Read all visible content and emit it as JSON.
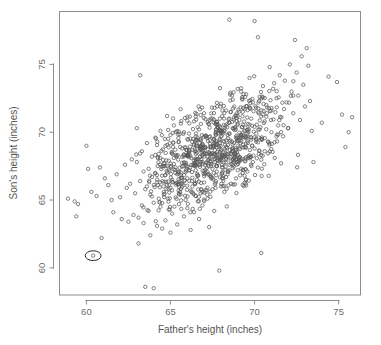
{
  "chart_data": {
    "type": "scatter",
    "title": "",
    "xlabel": "Father's height (inches)",
    "ylabel": "Son's height (inches)",
    "xlim": [
      58.4,
      76.3
    ],
    "ylim": [
      58.0,
      78.9
    ],
    "xticks": [
      60,
      65,
      70,
      75
    ],
    "yticks": [
      60,
      65,
      70,
      75
    ],
    "xtick_labels": [
      "60",
      "65",
      "70",
      "75"
    ],
    "ytick_labels": [
      "60",
      "65",
      "70",
      "75"
    ],
    "grid": false,
    "legend": "none",
    "marker": "open-circle",
    "marker_color": "#5a5a5a",
    "n_points": 1000,
    "annotation": {
      "type": "ellipse-highlight",
      "x": 60.4,
      "y": 60.9,
      "rx": 0.47,
      "ry": 0.36,
      "label": ""
    },
    "points": [
      [
        58.9,
        65.1
      ],
      [
        59.3,
        64.9
      ],
      [
        59.5,
        64.7
      ],
      [
        59.4,
        63.8
      ],
      [
        60.0,
        69.0
      ],
      [
        60.1,
        67.3
      ],
      [
        60.3,
        65.6
      ],
      [
        60.4,
        60.9
      ],
      [
        60.6,
        65.3
      ],
      [
        60.8,
        67.4
      ],
      [
        60.9,
        62.2
      ],
      [
        61.1,
        66.6
      ],
      [
        61.3,
        66.1
      ],
      [
        61.5,
        65.0
      ],
      [
        61.6,
        64.1
      ],
      [
        61.8,
        66.9
      ],
      [
        62.0,
        65.2
      ],
      [
        62.1,
        63.6
      ],
      [
        62.3,
        67.6
      ],
      [
        62.4,
        65.9
      ],
      [
        62.5,
        63.4
      ],
      [
        62.6,
        66.2
      ],
      [
        62.7,
        68.0
      ],
      [
        62.8,
        63.9
      ],
      [
        62.9,
        65.5
      ],
      [
        63.0,
        70.3
      ],
      [
        63.0,
        67.8
      ],
      [
        63.1,
        63.7
      ],
      [
        63.1,
        61.8
      ],
      [
        63.2,
        66.4
      ],
      [
        63.2,
        74.2
      ],
      [
        63.3,
        64.6
      ],
      [
        63.3,
        68.6
      ],
      [
        63.4,
        67.1
      ],
      [
        63.4,
        63.3
      ],
      [
        63.5,
        58.6
      ],
      [
        63.5,
        65.8
      ],
      [
        63.6,
        69.2
      ],
      [
        63.6,
        66.0
      ],
      [
        63.7,
        64.2
      ],
      [
        63.7,
        67.3
      ],
      [
        63.8,
        62.4
      ],
      [
        63.8,
        65.4
      ],
      [
        63.9,
        68.2
      ],
      [
        63.9,
        66.7
      ],
      [
        64.0,
        58.5
      ],
      [
        64.0,
        64.8
      ],
      [
        64.1,
        67.0
      ],
      [
        64.1,
        69.6
      ],
      [
        64.2,
        63.1
      ],
      [
        64.2,
        66.3
      ],
      [
        64.3,
        65.1
      ],
      [
        64.3,
        68.4
      ],
      [
        64.4,
        70.1
      ],
      [
        64.4,
        64.5
      ],
      [
        64.5,
        66.8
      ],
      [
        64.5,
        62.9
      ],
      [
        64.6,
        67.7
      ],
      [
        64.6,
        65.6
      ],
      [
        64.7,
        69.0
      ],
      [
        64.7,
        63.5
      ],
      [
        64.8,
        66.1
      ],
      [
        64.8,
        71.2
      ],
      [
        64.9,
        64.3
      ],
      [
        64.9,
        67.9
      ],
      [
        65.0,
        65.9
      ],
      [
        65.0,
        62.6
      ],
      [
        65.0,
        69.8
      ],
      [
        65.1,
        66.5
      ],
      [
        65.1,
        64.0
      ],
      [
        65.2,
        68.1
      ],
      [
        65.2,
        70.5
      ],
      [
        65.3,
        65.2
      ],
      [
        65.3,
        67.4
      ],
      [
        65.4,
        63.2
      ],
      [
        65.4,
        66.9
      ],
      [
        65.5,
        69.3
      ],
      [
        65.5,
        64.7
      ],
      [
        65.5,
        67.1
      ],
      [
        65.6,
        65.4
      ],
      [
        65.6,
        71.7
      ],
      [
        65.7,
        68.8
      ],
      [
        65.7,
        66.2
      ],
      [
        65.8,
        63.8
      ],
      [
        65.8,
        70.0
      ],
      [
        65.9,
        67.6
      ],
      [
        65.9,
        65.0
      ],
      [
        66.0,
        68.3
      ],
      [
        66.0,
        64.4
      ],
      [
        66.0,
        66.6
      ],
      [
        66.1,
        69.9
      ],
      [
        66.1,
        67.2
      ],
      [
        66.2,
        65.7
      ],
      [
        66.2,
        62.8
      ],
      [
        66.3,
        68.7
      ],
      [
        66.3,
        66.0
      ],
      [
        66.4,
        70.8
      ],
      [
        66.4,
        64.1
      ],
      [
        66.5,
        67.5
      ],
      [
        66.5,
        69.4
      ],
      [
        66.5,
        65.3
      ],
      [
        66.6,
        68.0
      ],
      [
        66.6,
        66.8
      ],
      [
        66.7,
        63.6
      ],
      [
        66.7,
        70.2
      ],
      [
        66.8,
        67.8
      ],
      [
        66.8,
        65.5
      ],
      [
        66.9,
        69.1
      ],
      [
        66.9,
        64.6
      ],
      [
        67.0,
        68.5
      ],
      [
        67.0,
        66.3
      ],
      [
        67.0,
        71.4
      ],
      [
        67.1,
        67.0
      ],
      [
        67.1,
        69.7
      ],
      [
        67.2,
        65.1
      ],
      [
        67.2,
        68.2
      ],
      [
        67.3,
        63.0
      ],
      [
        67.3,
        70.6
      ],
      [
        67.4,
        66.7
      ],
      [
        67.4,
        68.9
      ],
      [
        67.5,
        67.3
      ],
      [
        67.5,
        65.8
      ],
      [
        67.5,
        71.0
      ],
      [
        67.6,
        69.5
      ],
      [
        67.6,
        64.2
      ],
      [
        67.7,
        68.1
      ],
      [
        67.7,
        66.4
      ],
      [
        67.8,
        70.4
      ],
      [
        67.8,
        67.7
      ],
      [
        67.9,
        59.8
      ],
      [
        67.9,
        69.0
      ],
      [
        68.0,
        66.0
      ],
      [
        68.0,
        68.6
      ],
      [
        68.0,
        72.1
      ],
      [
        68.1,
        67.4
      ],
      [
        68.1,
        70.0
      ],
      [
        68.2,
        65.6
      ],
      [
        68.2,
        69.3
      ],
      [
        68.3,
        68.0
      ],
      [
        68.3,
        71.6
      ],
      [
        68.4,
        66.9
      ],
      [
        68.4,
        69.8
      ],
      [
        68.5,
        67.6
      ],
      [
        68.5,
        78.3
      ],
      [
        68.5,
        70.7
      ],
      [
        68.6,
        68.4
      ],
      [
        68.6,
        66.2
      ],
      [
        68.7,
        72.4
      ],
      [
        68.7,
        69.1
      ],
      [
        68.8,
        67.9
      ],
      [
        68.8,
        70.3
      ],
      [
        68.9,
        68.7
      ],
      [
        68.9,
        66.6
      ],
      [
        69.0,
        71.2
      ],
      [
        69.0,
        69.4
      ],
      [
        69.0,
        67.2
      ],
      [
        69.1,
        70.9
      ],
      [
        69.1,
        68.2
      ],
      [
        69.2,
        73.0
      ],
      [
        69.2,
        69.7
      ],
      [
        69.3,
        67.0
      ],
      [
        69.3,
        71.5
      ],
      [
        69.4,
        68.9
      ],
      [
        69.4,
        70.1
      ],
      [
        69.5,
        66.5
      ],
      [
        69.5,
        72.8
      ],
      [
        69.6,
        69.2
      ],
      [
        69.6,
        70.6
      ],
      [
        69.7,
        68.3
      ],
      [
        69.7,
        74.0
      ],
      [
        69.8,
        71.0
      ],
      [
        69.8,
        69.6
      ],
      [
        69.9,
        67.8
      ],
      [
        69.9,
        72.2
      ],
      [
        70.0,
        78.2
      ],
      [
        70.0,
        70.4
      ],
      [
        70.0,
        68.8
      ],
      [
        70.1,
        71.8
      ],
      [
        70.1,
        69.9
      ],
      [
        70.2,
        77.0
      ],
      [
        70.2,
        67.4
      ],
      [
        70.3,
        72.6
      ],
      [
        70.3,
        70.2
      ],
      [
        70.4,
        61.1
      ],
      [
        70.4,
        69.5
      ],
      [
        70.5,
        73.4
      ],
      [
        70.5,
        71.3
      ],
      [
        70.6,
        68.6
      ],
      [
        70.6,
        70.8
      ],
      [
        70.7,
        72.0
      ],
      [
        70.8,
        69.3
      ],
      [
        70.9,
        74.8
      ],
      [
        71.0,
        71.6
      ],
      [
        71.0,
        70.0
      ],
      [
        71.1,
        73.2
      ],
      [
        71.2,
        68.1
      ],
      [
        71.3,
        72.5
      ],
      [
        71.4,
        70.5
      ],
      [
        71.5,
        74.2
      ],
      [
        71.6,
        71.1
      ],
      [
        71.7,
        69.7
      ],
      [
        71.8,
        73.8
      ],
      [
        71.9,
        72.2
      ],
      [
        72.0,
        70.3
      ],
      [
        72.1,
        75.0
      ],
      [
        72.2,
        73.0
      ],
      [
        72.3,
        71.4
      ],
      [
        72.4,
        76.8
      ],
      [
        72.5,
        74.4
      ],
      [
        72.6,
        72.7
      ],
      [
        72.7,
        70.9
      ],
      [
        72.8,
        75.6
      ],
      [
        72.9,
        73.5
      ],
      [
        73.0,
        71.9
      ],
      [
        73.1,
        76.2
      ],
      [
        73.2,
        74.9
      ],
      [
        73.3,
        72.3
      ],
      [
        73.4,
        70.1
      ],
      [
        73.5,
        67.8
      ],
      [
        74.0,
        70.7
      ],
      [
        74.4,
        74.1
      ],
      [
        74.9,
        73.7
      ],
      [
        75.2,
        71.3
      ],
      [
        75.4,
        68.9
      ],
      [
        75.6,
        70.0
      ],
      [
        75.8,
        71.1
      ]
    ]
  },
  "axes": {
    "x_title": "Father's height (inches)",
    "y_title": "Son's height (inches)",
    "x_ticks": [
      "60",
      "65",
      "70",
      "75"
    ],
    "y_ticks": [
      "60",
      "65",
      "70",
      "75"
    ]
  }
}
